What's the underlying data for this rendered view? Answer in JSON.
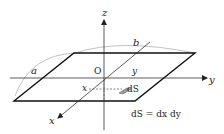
{
  "diagram": {
    "axes": {
      "z_label": "z",
      "y_label": "y",
      "x_label": "x",
      "origin_label": "O"
    },
    "region": {
      "side_a_label": "a",
      "side_b_label": "b",
      "inner_x_label": "x",
      "inner_y_label": "y"
    },
    "element": {
      "label": "dS",
      "formula": "dS = dx dy"
    },
    "colors": {
      "axis": "#333333",
      "region_edge": "#111111",
      "arc": "#aaaaaa",
      "dashed": "#555555",
      "patch": "#888888"
    }
  }
}
